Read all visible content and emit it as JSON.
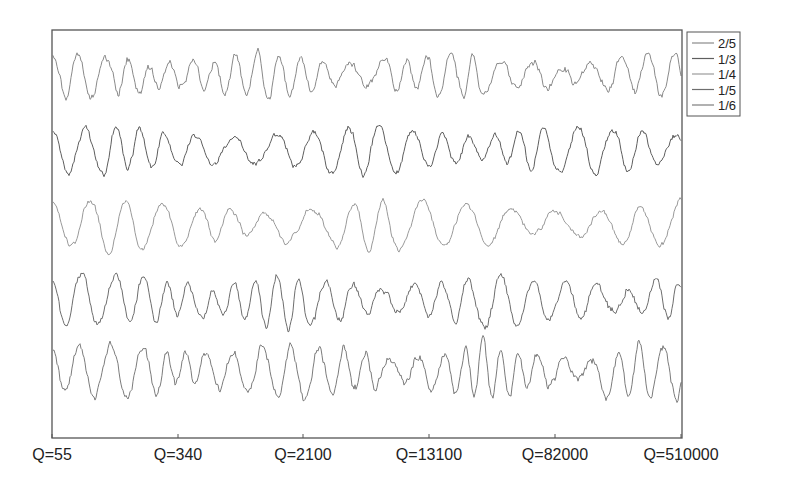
{
  "chart_data": {
    "type": "line",
    "title": "",
    "xlabel": "",
    "ylabel": "",
    "grid": false,
    "legend_position": "top-right-outside",
    "x_tick_labels": [
      "Q=55",
      "Q=340",
      "Q=2100",
      "Q=13100",
      "Q=82000",
      "Q=510000"
    ],
    "x_tick_positions_px": [
      52,
      178,
      303,
      429,
      555,
      681
    ],
    "series": [
      {
        "name": "2/5",
        "color": "#8a8a8a",
        "baseline_px": 75,
        "amplitude_px": 22,
        "period_px": 26,
        "noise": 0.55,
        "seed": 11
      },
      {
        "name": "1/3",
        "color": "#5e5e5e",
        "baseline_px": 150,
        "amplitude_px": 24,
        "period_px": 33,
        "noise": 0.45,
        "seed": 23
      },
      {
        "name": "1/4",
        "color": "#9a9a9a",
        "baseline_px": 225,
        "amplitude_px": 26,
        "period_px": 38,
        "noise": 0.4,
        "seed": 37
      },
      {
        "name": "1/5",
        "color": "#6e6e6e",
        "baseline_px": 300,
        "amplitude_px": 26,
        "period_px": 28,
        "noise": 0.55,
        "seed": 51
      },
      {
        "name": "1/6",
        "color": "#7c7c7c",
        "baseline_px": 372,
        "amplitude_px": 28,
        "period_px": 25,
        "noise": 0.6,
        "seed": 67
      }
    ]
  },
  "layout": {
    "plot": {
      "x": 52,
      "y": 30,
      "w": 630,
      "h": 408
    },
    "legend": {
      "x": 687,
      "y": 32,
      "w": 53,
      "h": 84
    },
    "frame_color": "#555555"
  }
}
